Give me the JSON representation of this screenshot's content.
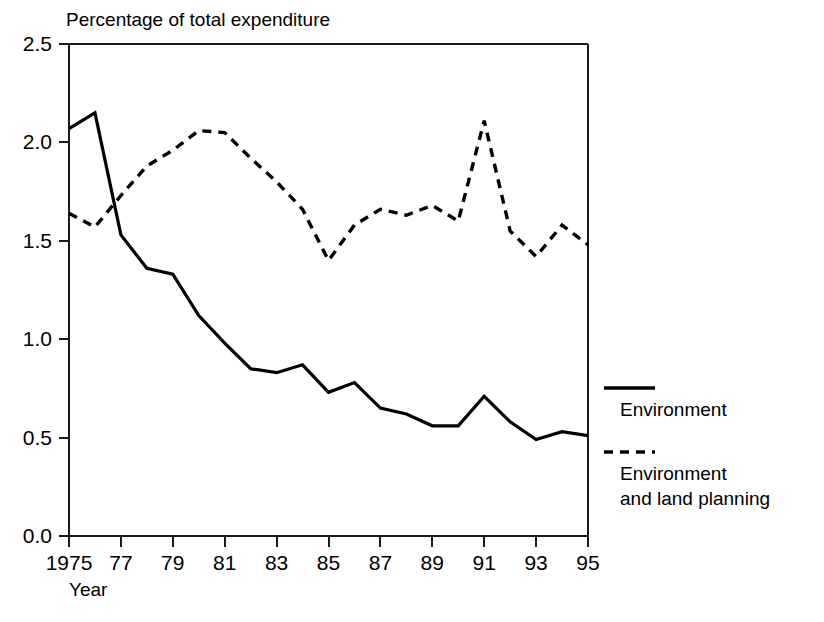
{
  "chart_data": {
    "type": "line",
    "title": "Percentage of total expenditure",
    "xlabel": "Year",
    "ylabel": "",
    "xlim": [
      1975,
      1995
    ],
    "ylim": [
      0.0,
      2.5
    ],
    "grid": false,
    "legend_position": "right",
    "x": [
      1975,
      1976,
      1977,
      1978,
      1979,
      1980,
      1981,
      1982,
      1983,
      1984,
      1985,
      1986,
      1987,
      1988,
      1989,
      1990,
      1991,
      1992,
      1993,
      1994,
      1995
    ],
    "xtick_labels": [
      "1975",
      "77",
      "79",
      "81",
      "83",
      "85",
      "87",
      "89",
      "91",
      "93",
      "95"
    ],
    "xtick_values": [
      1975,
      1977,
      1979,
      1981,
      1983,
      1985,
      1987,
      1989,
      1991,
      1993,
      1995
    ],
    "ytick_labels": [
      "0.0",
      "0.5",
      "1.0",
      "1.5",
      "2.0",
      "2.5"
    ],
    "ytick_values": [
      0.0,
      0.5,
      1.0,
      1.5,
      2.0,
      2.5
    ],
    "series": [
      {
        "name": "Environment",
        "style": "solid",
        "color": "#000000",
        "values": [
          2.07,
          2.15,
          1.53,
          1.36,
          1.33,
          1.12,
          0.98,
          0.85,
          0.83,
          0.87,
          0.73,
          0.78,
          0.65,
          0.62,
          0.56,
          0.56,
          0.71,
          0.58,
          0.49,
          0.53,
          0.51
        ]
      },
      {
        "name": "Environment and land planning",
        "style": "dashed",
        "color": "#000000",
        "values": [
          1.64,
          1.57,
          1.73,
          1.88,
          1.96,
          2.06,
          2.05,
          1.92,
          1.8,
          1.66,
          1.4,
          1.58,
          1.66,
          1.63,
          1.68,
          1.6,
          2.11,
          1.55,
          1.42,
          1.58,
          1.48
        ]
      }
    ],
    "legend_entries": [
      {
        "label": "Environment",
        "style": "solid",
        "line2": ""
      },
      {
        "label": "Environment",
        "style": "dashed",
        "line2": "and land planning"
      }
    ]
  },
  "legend": {
    "entry1_line1": "Environment",
    "entry2_line1": "Environment",
    "entry2_line2": "and land planning"
  }
}
